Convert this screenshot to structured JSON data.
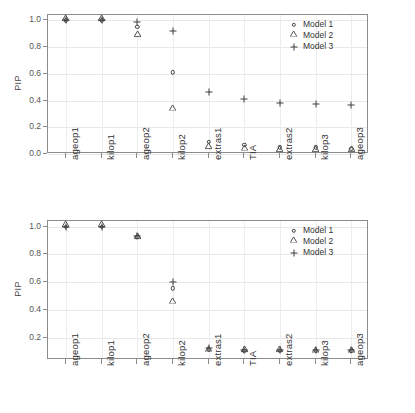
{
  "figure": {
    "background": "#ffffff",
    "axis_color": "#8c8c8c",
    "grid_color": "#e8e8e8",
    "marker_color": "#3f3f3f"
  },
  "legend": {
    "entries": [
      {
        "label": "Model 1",
        "marker": "circle"
      },
      {
        "label": "Model 2",
        "marker": "triangle"
      },
      {
        "label": "Model 3",
        "marker": "plus"
      }
    ]
  },
  "chart_data": [
    {
      "type": "scatter",
      "panel": "top",
      "title": "",
      "xlabel": "",
      "ylabel": "PIP",
      "ylim": [
        0.0,
        1.04
      ],
      "yticks": [
        "0.0",
        "0.2",
        "0.4",
        "0.6",
        "0.8",
        "1.0"
      ],
      "ytick_values": [
        0.0,
        0.2,
        0.4,
        0.6,
        0.8,
        1.0
      ],
      "grid": true,
      "legend_position": "top-right",
      "categories": [
        "ageop1",
        "kilop1",
        "ageop2",
        "kilop2",
        "extras1",
        "TIA",
        "extras2",
        "kilop3",
        "ageop3"
      ],
      "series": [
        {
          "name": "Model 1",
          "marker": "circle",
          "values": [
            1.0,
            1.0,
            0.95,
            0.61,
            0.09,
            0.07,
            0.05,
            0.05,
            0.04
          ]
        },
        {
          "name": "Model 2",
          "marker": "triangle",
          "values": [
            1.0,
            1.0,
            0.88,
            0.33,
            0.04,
            0.03,
            0.02,
            0.02,
            0.02
          ]
        },
        {
          "name": "Model 3",
          "marker": "plus",
          "values": [
            1.0,
            1.0,
            0.99,
            0.92,
            0.465,
            0.41,
            0.38,
            0.375,
            0.37
          ]
        }
      ]
    },
    {
      "type": "scatter",
      "panel": "bottom",
      "title": "",
      "xlabel": "",
      "ylabel": "PIP",
      "ylim": [
        0.04,
        1.04
      ],
      "yticks": [
        "0.2",
        "0.4",
        "0.6",
        "0.8",
        "1.0"
      ],
      "ytick_values": [
        0.2,
        0.4,
        0.6,
        0.8,
        1.0
      ],
      "grid": true,
      "legend_position": "top-right",
      "categories": [
        "ageop1",
        "kilop1",
        "ageop2",
        "kilop2",
        "extras1",
        "TIA",
        "extras2",
        "kilop3",
        "ageop3"
      ],
      "series": [
        {
          "name": "Model 1",
          "marker": "circle",
          "values": [
            1.0,
            1.0,
            0.925,
            0.555,
            0.115,
            0.105,
            0.105,
            0.105,
            0.105
          ]
        },
        {
          "name": "Model 2",
          "marker": "triangle",
          "values": [
            1.0,
            1.0,
            0.915,
            0.45,
            0.105,
            0.1,
            0.1,
            0.098,
            0.098
          ]
        },
        {
          "name": "Model 3",
          "marker": "plus",
          "values": [
            1.0,
            1.0,
            0.935,
            0.6,
            0.125,
            0.115,
            0.115,
            0.115,
            0.115
          ]
        }
      ]
    }
  ]
}
